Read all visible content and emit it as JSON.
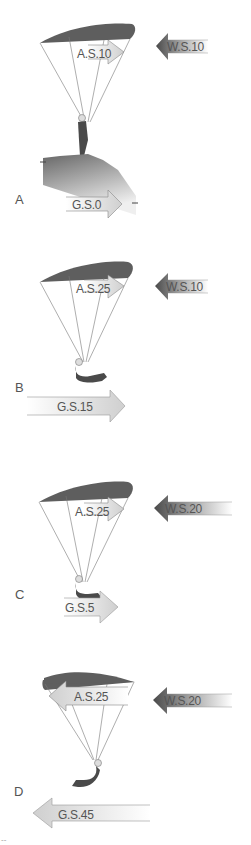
{
  "panels": [
    {
      "id": "A",
      "letter": "A",
      "airspeed": "A.S.10",
      "windspeed": "W.S.10",
      "groundspeed": "G.S.0",
      "wing_direction": "right",
      "state": "standing on launch slope"
    },
    {
      "id": "B",
      "letter": "B",
      "airspeed": "A.S.25",
      "windspeed": "W.S.10",
      "groundspeed": "G.S.15",
      "wing_direction": "right",
      "state": "flying into wind"
    },
    {
      "id": "C",
      "letter": "C",
      "airspeed": "A.S.25",
      "windspeed": "W.S.20",
      "groundspeed": "G.S.5",
      "wing_direction": "right",
      "state": "flying into strong wind"
    },
    {
      "id": "D",
      "letter": "D",
      "airspeed": "A.S.25",
      "windspeed": "W.S.20",
      "groundspeed": "G.S.45",
      "wing_direction": "left",
      "state": "flying downwind"
    }
  ],
  "colors": {
    "wing": "#5e5e5e",
    "wind_arrow_dark": "#555555",
    "arrow_light": "#d8d8d8",
    "text": "#555555",
    "ground_dark": "#6f6f6f",
    "ground_light": "#ececec"
  },
  "footer_mark": "--"
}
